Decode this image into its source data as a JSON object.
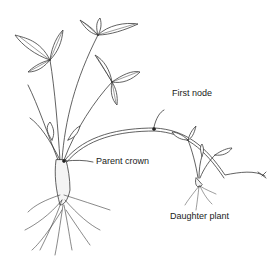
{
  "diagram": {
    "labels": {
      "first_node": "First node",
      "parent_crown": "Parent crown",
      "daughter_plant": "Daughter plant"
    },
    "colors": {
      "line": "#3a3a3a",
      "text": "#1a1a1a",
      "background": "#ffffff"
    }
  }
}
